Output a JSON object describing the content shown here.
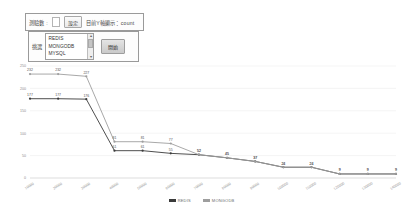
{
  "controls": {
    "top_panel": {
      "count_label": "測驗數 :",
      "count_value": "",
      "set_button": "設定",
      "y_axis_label": "目前Y軸顯示：count"
    },
    "bottom_panel": {
      "select_label": "挑選",
      "options": [
        "REDIS",
        "MONGODB",
        "MYSQL"
      ],
      "go_button": "開始",
      "scroll_up_icon": "caret-up-icon",
      "scroll_down_icon": "caret-down-icon"
    }
  },
  "chart_data": {
    "type": "line",
    "title": "",
    "xlabel": "",
    "ylabel": "count",
    "ylim": [
      0,
      250
    ],
    "yticks": [
      0,
      50,
      100,
      150,
      200,
      250
    ],
    "grid": true,
    "legend_position": "bottom",
    "categories": [
      "10000",
      "20000",
      "30000",
      "40000",
      "50000",
      "60000",
      "70000",
      "80000",
      "90000",
      "100000",
      "110000",
      "120000",
      "130000",
      "140000"
    ],
    "series": [
      {
        "name": "REDIS",
        "color": "#3a3a3a",
        "values": [
          177,
          177,
          176,
          61,
          61,
          55,
          52,
          45,
          37,
          24,
          24,
          9,
          9,
          9
        ]
      },
      {
        "name": "MONGODB",
        "color": "#9e9e9e",
        "values": [
          232,
          232,
          227,
          81,
          81,
          77,
          52,
          45,
          37,
          24,
          24,
          9,
          9,
          9
        ]
      }
    ]
  }
}
